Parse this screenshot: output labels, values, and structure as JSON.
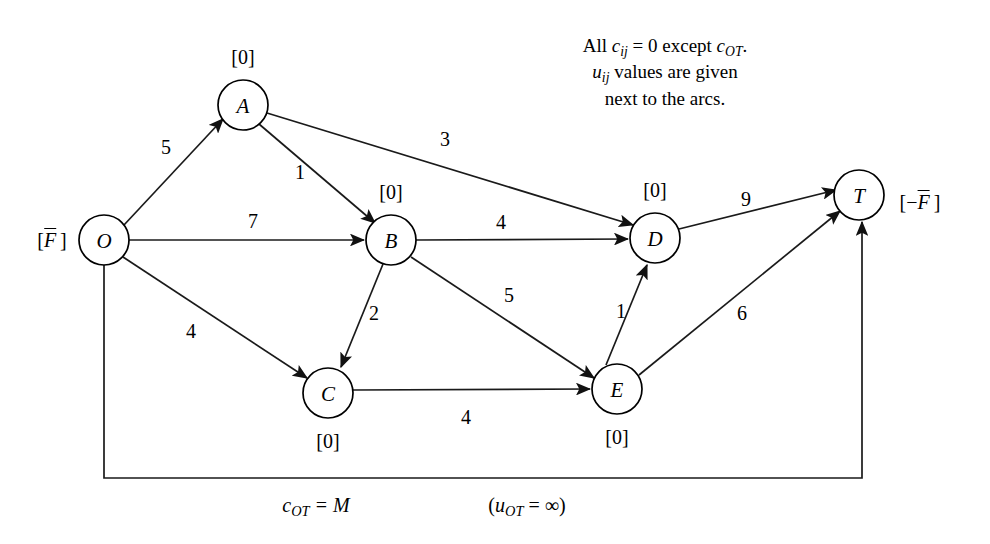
{
  "diagram": {
    "title_caption": {
      "line1_prefix": "All ",
      "line1_c": "c",
      "line1_sub1": "ij",
      "line1_mid": " = 0 except ",
      "line1_c2": "c",
      "line1_sub2": "OT",
      "line1_end": ".",
      "line2_u": "u",
      "line2_sub": "ij",
      "line2_text": " values are given",
      "line3": "next to the arcs."
    },
    "bottom_cost": {
      "c": "c",
      "sub": "OT",
      "eq": " = M"
    },
    "bottom_capacity": {
      "open": "(",
      "u": "u",
      "sub": "OT",
      "eq": " = ∞)"
    },
    "nodes": [
      {
        "id": "O",
        "label": "O",
        "cx": 104,
        "cy": 240,
        "r": 25,
        "supply": "[F̄]",
        "supply_x": 52,
        "supply_y": 240,
        "supply_kind": "F-bar"
      },
      {
        "id": "A",
        "label": "A",
        "cx": 243,
        "cy": 105,
        "r": 25,
        "supply": "[0]",
        "supply_x": 243,
        "supply_y": 57,
        "supply_kind": "zero"
      },
      {
        "id": "B",
        "label": "B",
        "cx": 391,
        "cy": 240,
        "r": 25,
        "supply": "[0]",
        "supply_x": 391,
        "supply_y": 192,
        "supply_kind": "zero"
      },
      {
        "id": "C",
        "label": "C",
        "cx": 328,
        "cy": 393,
        "r": 25,
        "supply": "[0]",
        "supply_x": 328,
        "supply_y": 441,
        "supply_kind": "zero"
      },
      {
        "id": "D",
        "label": "D",
        "cx": 655,
        "cy": 238,
        "r": 25,
        "supply": "[0]",
        "supply_x": 655,
        "supply_y": 190,
        "supply_kind": "zero"
      },
      {
        "id": "E",
        "label": "E",
        "cx": 617,
        "cy": 389,
        "r": 25,
        "supply": "[0]",
        "supply_x": 617,
        "supply_y": 437,
        "supply_kind": "zero"
      },
      {
        "id": "T",
        "label": "T",
        "cx": 859,
        "cy": 195,
        "r": 25,
        "supply": "[−F̄ ]",
        "supply_x": 920,
        "supply_y": 202,
        "supply_kind": "neg-F-bar"
      }
    ],
    "arcs": [
      {
        "from": "O",
        "to": "A",
        "capacity": "5",
        "label_x": 166,
        "label_y": 147
      },
      {
        "from": "A",
        "to": "B",
        "capacity": "1",
        "label_x": 300,
        "label_y": 172
      },
      {
        "from": "O",
        "to": "B",
        "capacity": "7",
        "label_x": 253,
        "label_y": 221
      },
      {
        "from": "O",
        "to": "C",
        "capacity": "4",
        "label_x": 191,
        "label_y": 331
      },
      {
        "from": "B",
        "to": "C",
        "capacity": "2",
        "label_x": 374,
        "label_y": 313
      },
      {
        "from": "A",
        "to": "D",
        "capacity": "3",
        "label_x": 445,
        "label_y": 139
      },
      {
        "from": "B",
        "to": "D",
        "capacity": "4",
        "label_x": 501,
        "label_y": 222
      },
      {
        "from": "B",
        "to": "E",
        "capacity": "5",
        "label_x": 509,
        "label_y": 295
      },
      {
        "from": "C",
        "to": "E",
        "capacity": "4",
        "label_x": 466,
        "label_y": 417
      },
      {
        "from": "E",
        "to": "D",
        "capacity": "1",
        "label_x": 621,
        "label_y": 311
      },
      {
        "from": "D",
        "to": "T",
        "capacity": "9",
        "label_x": 746,
        "label_y": 199
      },
      {
        "from": "E",
        "to": "T",
        "capacity": "6",
        "label_x": 742,
        "label_y": 313
      },
      {
        "from": "O",
        "to": "T",
        "capacity": "",
        "label_x": 0,
        "label_y": 0
      }
    ]
  }
}
